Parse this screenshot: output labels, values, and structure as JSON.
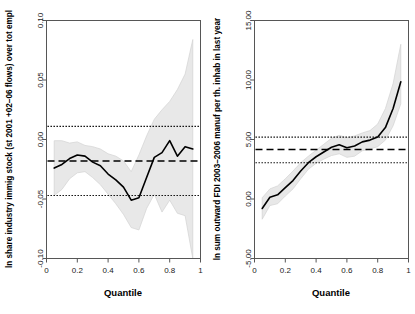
{
  "figure": {
    "background": "#ffffff",
    "panel_count": 2,
    "band_color": "#e8e8e8",
    "curve_color": "#000000",
    "frame_color": "#565656"
  },
  "chart_data": [
    {
      "type": "line",
      "panel": "left",
      "title": "",
      "xlabel": "Quantile",
      "ylabel": "ln share industry immig stock (st 2001 +02–06 flows) over tot empl",
      "xlim": [
        0,
        1
      ],
      "ylim": [
        -0.1,
        0.1
      ],
      "xticks": [
        "0",
        "0.2",
        "0.4",
        "0.6",
        "0.8",
        "1"
      ],
      "xtick_values": [
        0,
        0.2,
        0.4,
        0.6,
        0.8,
        1
      ],
      "yticks": [
        "0.10",
        "0.05",
        "0.00",
        "-0.05",
        "-0.10"
      ],
      "ytick_values": [
        0.1,
        0.05,
        0.0,
        -0.05,
        -0.1
      ],
      "grid": false,
      "legend": "none",
      "x": [
        0.05,
        0.1,
        0.15,
        0.2,
        0.25,
        0.3,
        0.35,
        0.4,
        0.45,
        0.5,
        0.55,
        0.6,
        0.65,
        0.7,
        0.75,
        0.8,
        0.85,
        0.9,
        0.95
      ],
      "series": [
        {
          "name": "quantile coefficient",
          "values": [
            -0.024,
            -0.021,
            -0.016,
            -0.013,
            -0.014,
            -0.019,
            -0.022,
            -0.029,
            -0.034,
            -0.04,
            -0.051,
            -0.049,
            -0.032,
            -0.015,
            -0.011,
            -0.001,
            -0.014,
            -0.006,
            -0.008
          ]
        },
        {
          "name": "ci upper",
          "values": [
            -0.001,
            -0.001,
            -0.003,
            -0.002,
            -0.005,
            -0.006,
            -0.008,
            -0.012,
            -0.014,
            -0.018,
            -0.027,
            -0.013,
            0.003,
            0.017,
            0.025,
            0.032,
            0.042,
            0.055,
            0.084
          ]
        },
        {
          "name": "ci lower",
          "values": [
            -0.047,
            -0.042,
            -0.033,
            -0.028,
            -0.027,
            -0.032,
            -0.038,
            -0.046,
            -0.054,
            -0.063,
            -0.074,
            -0.076,
            -0.058,
            -0.046,
            -0.061,
            -0.051,
            -0.062,
            -0.064,
            -0.1
          ]
        }
      ],
      "reference_lines": [
        {
          "name": "ols-upper-ci",
          "style": "dotted",
          "value": 0.011
        },
        {
          "name": "ols-estimate",
          "style": "dashed",
          "value": -0.018
        },
        {
          "name": "ols-lower-ci",
          "style": "dotted",
          "value": -0.047
        }
      ]
    },
    {
      "type": "line",
      "panel": "right",
      "title": "",
      "xlabel": "Quantile",
      "ylabel": "ln sum outward FDI 2003–2006 manuf per th. inhab in last year",
      "xlim": [
        0,
        1
      ],
      "ylim": [
        -5.0,
        15.0
      ],
      "xticks": [
        "0",
        "0.2",
        "0.4",
        "0.6",
        "0.8",
        "1"
      ],
      "xtick_values": [
        0,
        0.2,
        0.4,
        0.6,
        0.8,
        1
      ],
      "yticks": [
        "15.00",
        "10.00",
        "5.00",
        "0.00",
        "-5.00"
      ],
      "ytick_values": [
        15.0,
        10.0,
        5.0,
        0.0,
        -5.0
      ],
      "grid": false,
      "legend": "none",
      "x": [
        0.05,
        0.1,
        0.15,
        0.2,
        0.25,
        0.3,
        0.35,
        0.4,
        0.45,
        0.5,
        0.55,
        0.6,
        0.65,
        0.7,
        0.75,
        0.8,
        0.85,
        0.9,
        0.95
      ],
      "series": [
        {
          "name": "quantile coefficient",
          "values": [
            -0.8,
            0.15,
            0.35,
            0.95,
            1.55,
            2.35,
            3.05,
            3.55,
            3.95,
            4.35,
            4.55,
            4.3,
            4.45,
            4.8,
            4.95,
            5.2,
            6.0,
            7.6,
            9.85
          ]
        },
        {
          "name": "ci upper",
          "values": [
            0.1,
            0.85,
            1.1,
            1.7,
            2.35,
            3.05,
            3.6,
            4.1,
            4.6,
            5.1,
            5.35,
            5.15,
            5.3,
            5.55,
            5.75,
            6.3,
            7.6,
            9.7,
            13.0
          ]
        },
        {
          "name": "ci lower",
          "values": [
            -1.7,
            -0.55,
            -0.4,
            0.25,
            0.85,
            1.7,
            2.5,
            3.0,
            3.35,
            3.65,
            3.8,
            3.5,
            3.6,
            4.05,
            4.2,
            4.4,
            4.95,
            6.15,
            8.0
          ]
        }
      ],
      "reference_lines": [
        {
          "name": "ols-upper-ci",
          "style": "dotted",
          "value": 5.2
        },
        {
          "name": "ols-estimate",
          "style": "dashed",
          "value": 4.15
        },
        {
          "name": "ols-lower-ci",
          "style": "dotted",
          "value": 3.05
        }
      ]
    }
  ]
}
